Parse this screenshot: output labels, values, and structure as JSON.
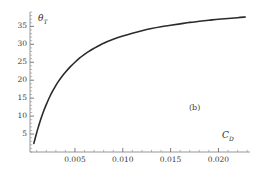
{
  "figure": {
    "panel_label": "(b)",
    "background_color": "#ffffff",
    "curve_color": "#2b2b2b",
    "axis_color": "#8a8a8a",
    "text_color": "#3a3a3a"
  },
  "axes": {
    "y_label_symbol": "θ",
    "y_label_subscript": "T",
    "x_label_symbol": "C",
    "x_label_subscript": "D"
  },
  "chart_data": {
    "type": "line",
    "title": "",
    "subtitle": "",
    "xlabel": "C_D",
    "ylabel": "θ_T",
    "annotations": [
      {
        "text": "(b)",
        "x": 0.0165,
        "y": 12.5
      }
    ],
    "legend": [],
    "legend_position": "none",
    "grid": false,
    "xlim": [
      0.0003,
      0.0233
    ],
    "ylim": [
      0,
      39
    ],
    "xticks": [
      0.005,
      0.01,
      0.015,
      0.02
    ],
    "xtick_labels": [
      "0.005",
      "0.010",
      "0.015",
      "0.020"
    ],
    "yticks": [
      5,
      10,
      15,
      20,
      25,
      30,
      35
    ],
    "ytick_labels": [
      "5",
      "10",
      "15",
      "20",
      "25",
      "30",
      "35"
    ],
    "x_minor_tick_step": 0.001,
    "y_minor_tick_step": 1,
    "series": [
      {
        "name": "theta_T vs C_D",
        "color": "#2b2b2b",
        "line_width": 1.6,
        "x": [
          0.0007,
          0.0009,
          0.0011,
          0.0014,
          0.0017,
          0.002,
          0.0024,
          0.0028,
          0.0032,
          0.0036,
          0.004,
          0.0045,
          0.005,
          0.0055,
          0.006,
          0.0065,
          0.007,
          0.008,
          0.009,
          0.01,
          0.011,
          0.012,
          0.013,
          0.014,
          0.015,
          0.016,
          0.017,
          0.018,
          0.019,
          0.02,
          0.021,
          0.022,
          0.0228
        ],
        "y": [
          2.4,
          4.4,
          6.3,
          8.9,
          11.2,
          13.2,
          15.6,
          17.6,
          19.4,
          20.9,
          22.2,
          23.7,
          25.0,
          26.2,
          27.2,
          28.1,
          28.9,
          30.3,
          31.4,
          32.3,
          33.1,
          33.8,
          34.4,
          34.9,
          35.3,
          35.7,
          36.1,
          36.4,
          36.7,
          37.0,
          37.2,
          37.4,
          37.6
        ]
      }
    ]
  }
}
